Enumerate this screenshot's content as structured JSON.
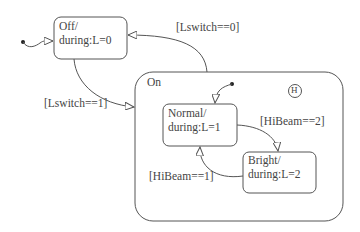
{
  "diagram": {
    "type": "statechart",
    "states": {
      "off": {
        "name": "Off/",
        "action": "during:L=0"
      },
      "on": {
        "name": "On"
      },
      "normal": {
        "name": "Normal/",
        "action": "during:L=1"
      },
      "bright": {
        "name": "Bright/",
        "action": "during:L=2"
      }
    },
    "history_junction": "H",
    "transitions": {
      "off_to_on": "[Lswitch==1]",
      "on_to_off": "[Lswitch==0]",
      "normal_to_bright": "[HiBeam==2]",
      "bright_to_normal": "[HiBeam==1]"
    },
    "colors": {
      "stroke": "#555555",
      "background": "#ffffff",
      "text": "#444444"
    }
  }
}
